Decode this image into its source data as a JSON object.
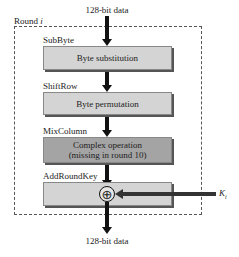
{
  "diagram": {
    "input_label": "128-bit data",
    "output_label": "128-bit data",
    "round_label": "Round ",
    "round_index": "i",
    "steps": [
      {
        "name": "SubByte",
        "description": "Byte substitution",
        "shade": "light"
      },
      {
        "name": "ShiftRow",
        "description": "Byte permutation",
        "shade": "light"
      },
      {
        "name": "MixColumn",
        "description_line1": "Complex operation",
        "description_line2": "(missing in round 10)",
        "shade": "dark"
      },
      {
        "name": "AddRoundKey",
        "operator": "⊕",
        "shade": "light"
      }
    ],
    "key_label": "K",
    "key_subscript": "i"
  },
  "colors": {
    "light_box": "#d4d4d4",
    "dark_box": "#a4a4a4",
    "arrow": "#111111"
  }
}
